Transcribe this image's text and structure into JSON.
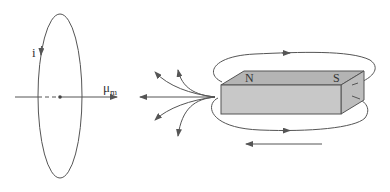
{
  "diagram": {
    "loop": {
      "current_label": "i",
      "moment_label_main": "μ",
      "moment_label_sub": "m"
    },
    "magnet": {
      "north_label": "N",
      "south_label": "S",
      "face_color": "#c8c8c8",
      "top_color": "#b4b4b4",
      "side_color": "#bdbdbd"
    },
    "colors": {
      "line": "#555555",
      "background": "#ffffff"
    }
  }
}
